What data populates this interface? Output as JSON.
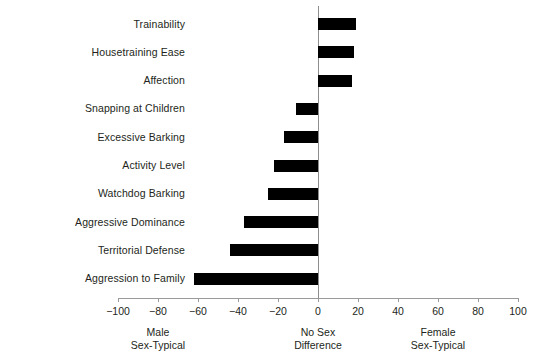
{
  "chart_data": {
    "type": "bar",
    "orientation": "horizontal",
    "title": "",
    "xlabel": "",
    "ylabel": "",
    "xlim": [
      -100,
      100
    ],
    "xticks": [
      -100,
      -80,
      -60,
      -40,
      -20,
      0,
      20,
      40,
      60,
      80,
      100
    ],
    "xtick_labels": [
      "−100",
      "−80",
      "−60",
      "−40",
      "−20",
      "0",
      "20",
      "40",
      "60",
      "80",
      "100"
    ],
    "grid": false,
    "legend": null,
    "bar_color": "#000000",
    "axis_color": "#9a9a9a",
    "zero_reference_line": 0,
    "categories": [
      "Trainability",
      "Housetraining Ease",
      "Affection",
      "Snapping at Children",
      "Excessive Barking",
      "Activity Level",
      "Watchdog Barking",
      "Aggressive Dominance",
      "Territorial Defense",
      "Aggression to Family"
    ],
    "values": [
      19,
      18,
      17,
      -11,
      -17,
      -22,
      -25,
      -37,
      -44,
      -62
    ],
    "annotations": [
      {
        "at": -80,
        "line1": "Male",
        "line2": "Sex-Typical"
      },
      {
        "at": 0,
        "line1": "No Sex",
        "line2": "Difference"
      },
      {
        "at": 60,
        "line1": "Female",
        "line2": "Sex-Typical"
      }
    ]
  }
}
